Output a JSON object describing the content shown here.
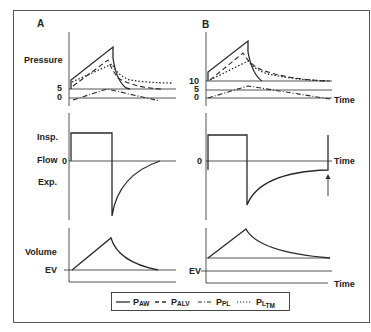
{
  "figure": {
    "panels": [
      {
        "id": "A",
        "label": "A"
      },
      {
        "id": "B",
        "label": "B"
      }
    ],
    "row_labels": {
      "pressure": "Pressure",
      "flow": "Flow",
      "insp": "Insp.",
      "exp": "Exp.",
      "volume": "Volume",
      "ev": "EV"
    },
    "ticks": {
      "A_pressure": [
        "5",
        "0"
      ],
      "B_pressure": [
        "10",
        "5",
        "0"
      ],
      "flow_zero": "0"
    },
    "axis_label_time": "Time",
    "legend": [
      {
        "style": "solid",
        "label": "P",
        "sub": "AW"
      },
      {
        "style": "dashed",
        "label": "P",
        "sub": "ALV"
      },
      {
        "style": "dash-dot",
        "label": "P",
        "sub": "PL"
      },
      {
        "style": "dotted",
        "label": "P",
        "sub": "L",
        "subsub": "TM"
      }
    ],
    "colors": {
      "line": "#2a2a2a",
      "frame": "#555555"
    }
  }
}
